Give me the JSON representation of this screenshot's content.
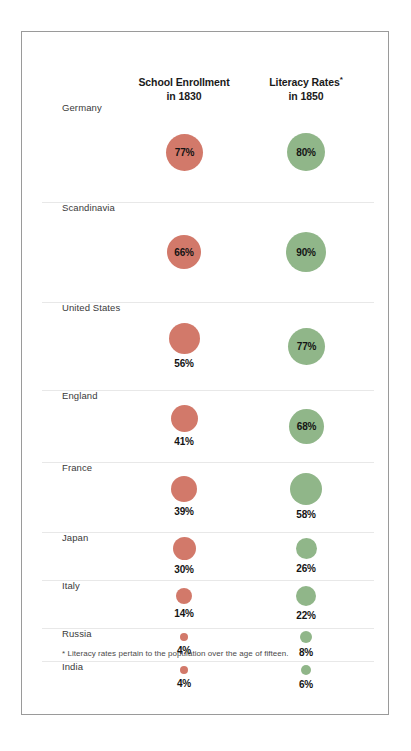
{
  "chart_data": {
    "type": "bar",
    "chart_style": "proportional-circle (bubble) comparison table",
    "title": "",
    "xlabel": "",
    "ylabel": "",
    "grid": false,
    "legend_position": "column headers",
    "categories": [
      "Germany",
      "Scandinavia",
      "United States",
      "England",
      "France",
      "Japan",
      "Italy",
      "Russia",
      "India"
    ],
    "series": [
      {
        "name": "School Enrollment in 1830",
        "color": "#d2796a",
        "unit": "%",
        "values": [
          77,
          66,
          56,
          41,
          39,
          30,
          14,
          4,
          4
        ],
        "value_labels": [
          "77%",
          "66%",
          "56%",
          "41%",
          "39%",
          "30%",
          "14%",
          "4%",
          "4%"
        ]
      },
      {
        "name": "Literacy Rates* in 1850",
        "color": "#90b689",
        "unit": "%",
        "values": [
          80,
          90,
          77,
          68,
          58,
          26,
          22,
          8,
          6
        ],
        "value_labels": [
          "80%",
          "90%",
          "77%",
          "68%",
          "58%",
          "26%",
          "22%",
          "8%",
          "6%"
        ]
      }
    ],
    "annotations": [
      "* Literacy rates pertain to the population over the age of fifteen."
    ]
  },
  "headers": {
    "col0_line1": "School Enrollment",
    "col0_line2": "in 1830",
    "col1_line1": "Literacy Rates",
    "col1_line1_marker": "*",
    "col1_line2": "in 1850"
  },
  "rows": [
    {
      "label": "Germany",
      "red": "77%",
      "green": "80%"
    },
    {
      "label": "Scandinavia",
      "red": "66%",
      "green": "90%"
    },
    {
      "label": "United States",
      "red": "56%",
      "green": "77%"
    },
    {
      "label": "England",
      "red": "41%",
      "green": "68%"
    },
    {
      "label": "France",
      "red": "39%",
      "green": "58%"
    },
    {
      "label": "Japan",
      "red": "30%",
      "green": "26%"
    },
    {
      "label": "Italy",
      "red": "14%",
      "green": "22%"
    },
    {
      "label": "Russia",
      "red": "4%",
      "green": "8%"
    },
    {
      "label": "India",
      "red": "4%",
      "green": "6%"
    }
  ],
  "footnote": "* Literacy rates pertain to the population over the age of fifteen.",
  "colors": {
    "red": "#d2796a",
    "green": "#90b689",
    "border": "#9a9a9a",
    "separator": "#e8e8e8",
    "label_text": "#3a3a3a",
    "value_text": "#141414"
  }
}
